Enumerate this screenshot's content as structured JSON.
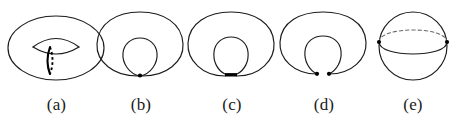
{
  "figure": {
    "caption_labels": [
      "(a)",
      "(b)",
      "(c)",
      "(d)",
      "(e)"
    ],
    "stroke_color": "#1a1a1a",
    "hidden_stroke_color": "#6a6a6a",
    "accent_color": "#000000",
    "background_color": "#ffffff",
    "panels": [
      {
        "id": "panel-a",
        "label": "(a)",
        "shape": "torus",
        "description": "Torus with highlighted meridian curve, solid on the front-left and dashed on the hidden right side",
        "marked_points": 0,
        "has_dashed_curve": true
      },
      {
        "id": "panel-b",
        "label": "(b)",
        "shape": "pinched-torus",
        "description": "Torus whose inner hole has contracted until the inner and outer boundaries meet at a single pinch point",
        "marked_points": 1,
        "has_dashed_curve": false
      },
      {
        "id": "panel-c",
        "label": "(c)",
        "shape": "pinched-torus-segment",
        "description": "Torus pinched along a short horizontal segment rather than a single point",
        "marked_points": 1,
        "has_dashed_curve": false
      },
      {
        "id": "panel-d",
        "label": "(d)",
        "shape": "split-neck",
        "description": "The pinched neck has separated into two distinct cusp points leaving an open gap",
        "marked_points": 2,
        "has_dashed_curve": false
      },
      {
        "id": "panel-e",
        "label": "(e)",
        "shape": "sphere",
        "description": "Resulting sphere drawn with an equator: dashed on the hidden far half, solid on the near half, with two marked points at the extremes",
        "marked_points": 2,
        "has_dashed_curve": true
      }
    ]
  }
}
